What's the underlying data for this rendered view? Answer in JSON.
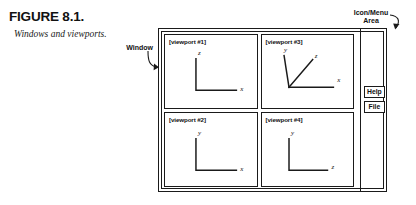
{
  "figure": {
    "number": "FIGURE 8.1.",
    "caption": "Windows and viewports."
  },
  "annotations": {
    "window": {
      "label": "Window",
      "arrow": "curved-arrow-right"
    },
    "icon_menu": {
      "label": "Icon/Menu\nArea",
      "arrow": "curved-arrow-down-left"
    }
  },
  "window_frame": {
    "viewports": [
      {
        "label": "[viewport #1]",
        "axes": [
          {
            "name": "z",
            "direction": "up"
          },
          {
            "name": "x",
            "direction": "right"
          }
        ]
      },
      {
        "label": "[viewport #3]",
        "axes": [
          {
            "name": "y",
            "direction": "up-left"
          },
          {
            "name": "z",
            "direction": "up-right"
          },
          {
            "name": "x",
            "direction": "right"
          }
        ]
      },
      {
        "label": "[viewport #2]",
        "axes": [
          {
            "name": "y",
            "direction": "up"
          },
          {
            "name": "x",
            "direction": "right"
          }
        ]
      },
      {
        "label": "[viewport #4]",
        "axes": [
          {
            "name": "y",
            "direction": "up"
          },
          {
            "name": "z",
            "direction": "right"
          }
        ]
      }
    ],
    "icon_menu_area": {
      "buttons": [
        {
          "label": "Help"
        },
        {
          "label": "File"
        }
      ]
    }
  },
  "colors": {
    "ink": "#1a1a1a",
    "paper": "#ffffff"
  }
}
